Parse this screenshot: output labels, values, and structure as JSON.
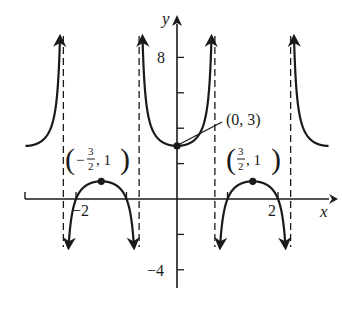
{
  "chart_data": {
    "type": "line",
    "title": "",
    "function": "y = 2 + sec(2πx/3)",
    "params": {
      "vertical_shift": 2,
      "amplitude": 1,
      "B": 2.0943951,
      "period": 3
    },
    "xlabel": "x",
    "ylabel": "y",
    "xlim": [
      -3,
      3.1
    ],
    "ylim": [
      -4.8,
      9.2
    ],
    "x_ticks": [
      -2,
      -1,
      1,
      2
    ],
    "x_tick_labels": [
      {
        "value": -2,
        "label": "−2"
      },
      {
        "value": 2,
        "label": "2"
      }
    ],
    "y_ticks": [
      -4,
      -2,
      2,
      4,
      6,
      8
    ],
    "y_tick_labels": [
      {
        "value": 8,
        "label": "8"
      },
      {
        "value": -4,
        "label": "−4"
      }
    ],
    "asymptotes": [
      -2.25,
      -0.75,
      0.75,
      2.25
    ],
    "grid": false,
    "branches": [
      {
        "name": "upper-left",
        "x_from": -3,
        "x_to": -2.25,
        "direction": "up"
      },
      {
        "name": "lower-left",
        "x_from": -2.25,
        "x_to": -0.75,
        "direction": "down"
      },
      {
        "name": "upper-center",
        "x_from": -0.75,
        "x_to": 0.75,
        "direction": "up"
      },
      {
        "name": "lower-right",
        "x_from": 0.75,
        "x_to": 2.25,
        "direction": "down"
      },
      {
        "name": "upper-right",
        "x_from": 2.25,
        "x_to": 3,
        "direction": "up"
      }
    ],
    "points": [
      {
        "x": -1.5,
        "y": 1,
        "label": "(−3/2, 1)"
      },
      {
        "x": 0,
        "y": 3,
        "label": "(0, 3)"
      },
      {
        "x": 1.5,
        "y": 1,
        "label": "(3/2, 1)"
      }
    ],
    "annotations": [
      {
        "text": "(0, 3)",
        "leader_line": true
      },
      {
        "text": "(−3/2, 1)"
      },
      {
        "text": "(3/2, 1)"
      }
    ],
    "colors": {
      "curve": "#1a1a1a",
      "axis": "#1a1a1a",
      "asymptote": "#1a1a1a",
      "background": "#ffffff"
    }
  },
  "labels": {
    "x_axis": "x",
    "y_axis": "y",
    "tick_8": "8",
    "tick_neg4": "−4",
    "tick_neg2": "−2",
    "tick_2": "2",
    "point_center": "(0, 3)",
    "point_left_open": "(",
    "point_left_minus": "−",
    "point_left_num": "3",
    "point_left_den": "2",
    "point_left_rest": ", 1",
    "point_left_close": ")",
    "point_right_open": "(",
    "point_right_num": "3",
    "point_right_den": "2",
    "point_right_rest": ", 1",
    "point_right_close": ")"
  }
}
